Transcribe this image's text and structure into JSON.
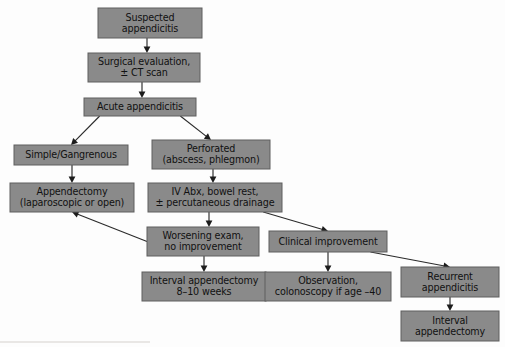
{
  "diagram": {
    "type": "flowchart",
    "style": {
      "box_fill": "#8a8a8a",
      "box_border": "#5e5e5e",
      "text_color": "#111111",
      "arrow_color": "#2b2b2b",
      "background": "#fdfdfd"
    },
    "nodes": [
      {
        "id": "suspected",
        "lines": [
          "Suspected",
          "appendicitis"
        ],
        "x": 98,
        "y": 8,
        "w": 104,
        "h": 30
      },
      {
        "id": "surgical_eval",
        "lines": [
          "Surgical evaluation,",
          "± CT scan"
        ],
        "x": 88,
        "y": 53,
        "w": 112,
        "h": 29
      },
      {
        "id": "acute",
        "lines": [
          "Acute appendicitis"
        ],
        "x": 84,
        "y": 98,
        "w": 112,
        "h": 18
      },
      {
        "id": "simple",
        "lines": [
          "Simple/Gangrenous"
        ],
        "x": 14,
        "y": 145,
        "w": 114,
        "h": 20
      },
      {
        "id": "perforated",
        "lines": [
          "Perforated",
          "(abscess, phlegmon)"
        ],
        "x": 152,
        "y": 140,
        "w": 118,
        "h": 29
      },
      {
        "id": "appendectomy",
        "lines": [
          "Appendectomy",
          "(laparoscopic or open)"
        ],
        "x": 10,
        "y": 183,
        "w": 124,
        "h": 29
      },
      {
        "id": "iv_abx",
        "lines": [
          "IV Abx, bowel rest,",
          "± percutaneous drainage"
        ],
        "x": 148,
        "y": 183,
        "w": 134,
        "h": 29
      },
      {
        "id": "worsening",
        "lines": [
          "Worsening exam,",
          "no improvement"
        ],
        "x": 147,
        "y": 227,
        "w": 112,
        "h": 29
      },
      {
        "id": "clinical_improvement",
        "lines": [
          "Clinical improvement"
        ],
        "x": 269,
        "y": 231,
        "w": 118,
        "h": 21
      },
      {
        "id": "interval_appy_8_10",
        "lines": [
          "Interval appendectomy",
          "8–10 weeks"
        ],
        "x": 142,
        "y": 272,
        "w": 124,
        "h": 29
      },
      {
        "id": "observation",
        "lines": [
          "Observation,",
          "colonoscopy if age –40"
        ],
        "x": 265,
        "y": 272,
        "w": 126,
        "h": 29
      },
      {
        "id": "recurrent",
        "lines": [
          "Recurrent",
          "appendicitis"
        ],
        "x": 401,
        "y": 267,
        "w": 98,
        "h": 30
      },
      {
        "id": "interval_appy_final",
        "lines": [
          "Interval",
          "appendectomy"
        ],
        "x": 401,
        "y": 311,
        "w": 98,
        "h": 30
      }
    ],
    "edges": [
      {
        "id": "suspected-to-surgical",
        "from": "suspected",
        "to": "surgical_eval",
        "kind": "vertical"
      },
      {
        "id": "surgical-to-acute",
        "from": "surgical_eval",
        "to": "acute",
        "kind": "vertical"
      },
      {
        "id": "acute-to-simple",
        "from": "acute",
        "to": "simple",
        "kind": "diagonal"
      },
      {
        "id": "acute-to-perforated",
        "from": "acute",
        "to": "perforated",
        "kind": "diagonal"
      },
      {
        "id": "simple-to-appendectomy",
        "from": "simple",
        "to": "appendectomy",
        "kind": "vertical"
      },
      {
        "id": "perforated-to-ivabx",
        "from": "perforated",
        "to": "iv_abx",
        "kind": "vertical"
      },
      {
        "id": "ivabx-to-worsening",
        "from": "iv_abx",
        "to": "worsening",
        "kind": "vertical"
      },
      {
        "id": "ivabx-to-improvement",
        "from": "iv_abx",
        "to": "clinical_improvement",
        "kind": "diagonal"
      },
      {
        "id": "worsening-to-appendectomy",
        "from": "worsening",
        "to": "appendectomy",
        "kind": "diagonal"
      },
      {
        "id": "worsening-to-interval",
        "from": "worsening",
        "to": "interval_appy_8_10",
        "kind": "vertical"
      },
      {
        "id": "improvement-to-observation",
        "from": "clinical_improvement",
        "to": "observation",
        "kind": "vertical"
      },
      {
        "id": "improvement-to-recurrent",
        "from": "clinical_improvement",
        "to": "recurrent",
        "kind": "diagonal"
      },
      {
        "id": "recurrent-to-interval",
        "from": "recurrent",
        "to": "interval_appy_final",
        "kind": "vertical"
      }
    ]
  }
}
